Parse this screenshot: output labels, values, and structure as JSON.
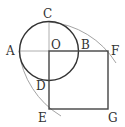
{
  "diagram": {
    "labels": {
      "A": "A",
      "B": "B",
      "C": "C",
      "D": "D",
      "E": "E",
      "F": "F",
      "G": "G",
      "O": "O"
    },
    "colors": {
      "stroke": "#333333",
      "thin": "#999999",
      "background": "#ffffff"
    }
  }
}
